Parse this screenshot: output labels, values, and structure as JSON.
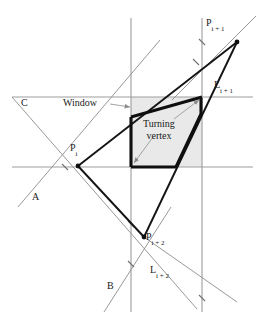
{
  "figure": {
    "colors": {
      "background": "#ffffff",
      "grid_line": "#9a9a9a",
      "thin_line": "#8a8a8a",
      "thick_line": "#141414",
      "window_fill": "#e8e8e8",
      "text": "#1a1a1a",
      "arrow": "#9a9a9a"
    },
    "window": {
      "label": "Window",
      "x_left": 131,
      "x_right": 202,
      "y_top": 97,
      "y_bottom": 167
    },
    "grid": {
      "vertical_x": [
        131,
        202
      ],
      "horizontal_y": [
        97,
        167
      ]
    },
    "annotations": {
      "turning_vertex_line1": "Turning",
      "turning_vertex_line2": "vertex"
    },
    "labels": [
      {
        "name": "point-p-i-plus-1",
        "base": "P",
        "sub": "i + 1",
        "x": 206,
        "y": 18
      },
      {
        "name": "line-l-i-plus-1",
        "base": "L",
        "sub": "i + 1",
        "x": 214,
        "y": 80
      },
      {
        "name": "ray-c",
        "base": "C",
        "sub": "",
        "x": 21,
        "y": 98
      },
      {
        "name": "point-p-i",
        "base": "P",
        "sub": "i",
        "x": 70,
        "y": 143
      },
      {
        "name": "ray-a",
        "base": "A",
        "sub": "",
        "x": 32,
        "y": 192
      },
      {
        "name": "point-p-i-plus-2",
        "base": "P",
        "sub": "i + 2",
        "x": 146,
        "y": 232
      },
      {
        "name": "line-l-i-plus-2",
        "base": "L",
        "sub": "i + 2",
        "x": 150,
        "y": 265
      },
      {
        "name": "ray-b",
        "base": "B",
        "sub": "",
        "x": 107,
        "y": 281
      }
    ],
    "vertices": {
      "p_i": {
        "x": 78,
        "y": 166
      },
      "p_i_plus_1": {
        "x": 237,
        "y": 42
      },
      "p_i_plus_2": {
        "x": 144,
        "y": 237
      }
    },
    "tick_marks": [
      {
        "x": 65,
        "y": 167
      },
      {
        "x": 131,
        "y": 224
      },
      {
        "x": 131,
        "y": 264
      },
      {
        "x": 202,
        "y": 42
      },
      {
        "x": 202,
        "y": 298
      },
      {
        "x": 196,
        "y": 62
      }
    ],
    "thick_polygon_points": "131,117 202,97 201,114 176,167 131,167",
    "clipped_chain_points": "131,117 202,97 201,114 176,167",
    "polyline_c_to_a": "12,97 78,166",
    "polyline_a_extension": "18,207 78,166",
    "edge_pi_to_pi1": "78,166 237,42",
    "edge_pi_to_pi2": "78,166 144,237",
    "edge_pi2_to_pi1": "144,237 237,42",
    "line_l_i_plus_1": "237,42 255,18",
    "line_l_i_plus_2_thin": "144,237 235,300",
    "line_b_thin": "104,300 160,213",
    "line_c_thin": "12,97 197,309",
    "window_label_arrow": {
      "x1": 112,
      "y1": 104,
      "x2": 131,
      "y2": 107
    },
    "tv_arrow_1": {
      "x1": 152,
      "y1": 136,
      "x2": 133,
      "y2": 164
    },
    "tv_arrow_2": {
      "x1": 172,
      "y1": 118,
      "x2": 199,
      "y2": 99
    }
  }
}
